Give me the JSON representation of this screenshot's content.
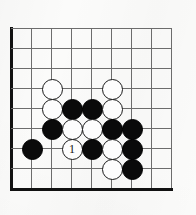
{
  "figure": {
    "kind": "go-board-diagram",
    "board_size_shown": 9,
    "width_px": 196,
    "height_px": 215,
    "background_color": "#fbfbfa"
  },
  "board": {
    "origin_x": 11,
    "origin_y": 28,
    "spacing": 20,
    "columns": 9,
    "rows": 9,
    "line_color": "#6d6d6d",
    "edge_color": "#111111",
    "edge_left_col": 0,
    "edge_bottom_row": 8,
    "grid_x": [
      11,
      31,
      51,
      71,
      91,
      111,
      131,
      151,
      171
    ],
    "grid_y": [
      28,
      48,
      68,
      88,
      108,
      128,
      148,
      168,
      188
    ]
  },
  "stones": {
    "black_color": "#0a0a0a",
    "white_color": "#fdfdfd",
    "diameter_px": 21,
    "items": [
      {
        "id": "w-c2r3",
        "color": "white",
        "col": 2,
        "row": 3,
        "label": ""
      },
      {
        "id": "w-c5r3",
        "color": "white",
        "col": 5,
        "row": 3,
        "label": ""
      },
      {
        "id": "w-c2r4",
        "color": "white",
        "col": 2,
        "row": 4,
        "label": ""
      },
      {
        "id": "b-c3r4",
        "color": "black",
        "col": 3,
        "row": 4,
        "label": ""
      },
      {
        "id": "b-c4r4",
        "color": "black",
        "col": 4,
        "row": 4,
        "label": ""
      },
      {
        "id": "w-c5r4",
        "color": "white",
        "col": 5,
        "row": 4,
        "label": ""
      },
      {
        "id": "b-c2r5",
        "color": "black",
        "col": 2,
        "row": 5,
        "label": ""
      },
      {
        "id": "w-c3r5",
        "color": "white",
        "col": 3,
        "row": 5,
        "label": ""
      },
      {
        "id": "w-c4r5",
        "color": "white",
        "col": 4,
        "row": 5,
        "label": ""
      },
      {
        "id": "b-c5r5",
        "color": "black",
        "col": 5,
        "row": 5,
        "label": ""
      },
      {
        "id": "b-c6r5",
        "color": "black",
        "col": 6,
        "row": 5,
        "label": ""
      },
      {
        "id": "b-c1r6",
        "color": "black",
        "col": 1,
        "row": 6,
        "label": ""
      },
      {
        "id": "w-c3r6-move1",
        "color": "white",
        "col": 3,
        "row": 6,
        "label": "1"
      },
      {
        "id": "b-c4r6",
        "color": "black",
        "col": 4,
        "row": 6,
        "label": ""
      },
      {
        "id": "w-c5r6",
        "color": "white",
        "col": 5,
        "row": 6,
        "label": ""
      },
      {
        "id": "b-c6r6",
        "color": "black",
        "col": 6,
        "row": 6,
        "label": ""
      },
      {
        "id": "w-c5r7",
        "color": "white",
        "col": 5,
        "row": 7,
        "label": ""
      },
      {
        "id": "b-c6r7",
        "color": "black",
        "col": 6,
        "row": 7,
        "label": ""
      }
    ]
  },
  "move_markers": [
    {
      "number": "1",
      "color": "white",
      "col": 3,
      "row": 6
    }
  ]
}
